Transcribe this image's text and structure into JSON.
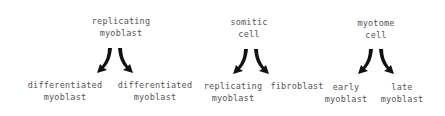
{
  "diagram": {
    "groups": [
      {
        "parent": {
          "line1": "replicating",
          "line2": "myoblast"
        },
        "children": [
          {
            "line1": "differentiated",
            "line2": "myoblast"
          },
          {
            "line1": "differentiated",
            "line2": "myoblast"
          }
        ]
      },
      {
        "parent": {
          "line1": "somitic",
          "line2": "cell"
        },
        "children": [
          {
            "line1": "replicating",
            "line2": "myoblast"
          },
          {
            "line1": "fibroblast",
            "line2": ""
          }
        ]
      },
      {
        "parent": {
          "line1": "myotome",
          "line2": "cell"
        },
        "children": [
          {
            "line1": "early",
            "line2": "myoblast"
          },
          {
            "line1": "late",
            "line2": "myoblast"
          }
        ]
      }
    ],
    "arrow_color": "#111111",
    "text_color": "#555555"
  }
}
